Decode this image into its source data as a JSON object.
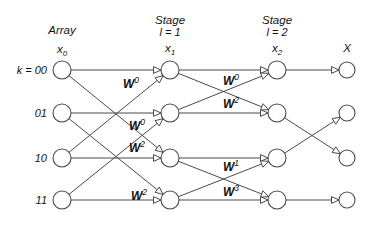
{
  "figure": {
    "background_color": "#ffffff",
    "line_color": "#4a4a4a",
    "text_color": "#111111"
  },
  "columns": [
    {
      "id": "input",
      "heading": "Array",
      "subheading": "",
      "variable": "x",
      "variable_subscript": "0",
      "cx": 62
    },
    {
      "id": "stage1",
      "heading": "Stage",
      "subheading": "l = 1",
      "variable": "x",
      "variable_subscript": "1",
      "cx": 170
    },
    {
      "id": "stage2",
      "heading": "Stage",
      "subheading": "l = 2",
      "variable": "x",
      "variable_subscript": "2",
      "cx": 277
    },
    {
      "id": "output",
      "heading": "",
      "subheading": "",
      "variable": "X",
      "variable_subscript": "",
      "cx": 347
    }
  ],
  "rows": [
    {
      "label": "k = 00",
      "cy": 70
    },
    {
      "label": "01",
      "cy": 113
    },
    {
      "label": "10",
      "cy": 158
    },
    {
      "label": "11",
      "cy": 200
    }
  ],
  "nodes": {
    "radius": 9,
    "output_radius": 8
  },
  "twiddle_labels": [
    {
      "base": "W",
      "exponent": "0",
      "x": 131,
      "y": 88,
      "stage": "stage1"
    },
    {
      "base": "W",
      "exponent": "0",
      "x": 137,
      "y": 130,
      "stage": "stage1"
    },
    {
      "base": "W",
      "exponent": "2",
      "x": 137,
      "y": 152,
      "stage": "stage1"
    },
    {
      "base": "W",
      "exponent": "2",
      "x": 139,
      "y": 200,
      "stage": "stage1"
    },
    {
      "base": "W",
      "exponent": "0",
      "x": 231,
      "y": 85,
      "stage": "stage2"
    },
    {
      "base": "W",
      "exponent": "2",
      "x": 231,
      "y": 108,
      "stage": "stage2"
    },
    {
      "base": "W",
      "exponent": "1",
      "x": 231,
      "y": 171,
      "stage": "stage2"
    },
    {
      "base": "W",
      "exponent": "3",
      "x": 231,
      "y": 196,
      "stage": "stage2"
    }
  ],
  "edges": {
    "stage1": [
      {
        "from_row": 0,
        "to_row": 0
      },
      {
        "from_row": 0,
        "to_row": 2
      },
      {
        "from_row": 1,
        "to_row": 1
      },
      {
        "from_row": 1,
        "to_row": 3
      },
      {
        "from_row": 2,
        "to_row": 0
      },
      {
        "from_row": 2,
        "to_row": 2
      },
      {
        "from_row": 3,
        "to_row": 1
      },
      {
        "from_row": 3,
        "to_row": 3
      }
    ],
    "stage2": [
      {
        "from_row": 0,
        "to_row": 0
      },
      {
        "from_row": 0,
        "to_row": 1
      },
      {
        "from_row": 1,
        "to_row": 0
      },
      {
        "from_row": 1,
        "to_row": 1
      },
      {
        "from_row": 2,
        "to_row": 2
      },
      {
        "from_row": 2,
        "to_row": 3
      },
      {
        "from_row": 3,
        "to_row": 2
      },
      {
        "from_row": 3,
        "to_row": 3
      }
    ],
    "output": [
      {
        "from_row": 0,
        "to_row": 0
      },
      {
        "from_row": 1,
        "to_row": 2
      },
      {
        "from_row": 2,
        "to_row": 1
      },
      {
        "from_row": 3,
        "to_row": 3
      }
    ]
  }
}
